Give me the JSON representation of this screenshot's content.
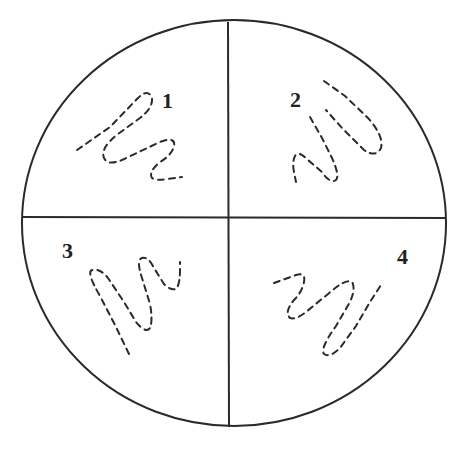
{
  "diagram": {
    "type": "petri-dish-streak-plate",
    "colors": {
      "line": "#2a2a2a",
      "background": "#ffffff"
    },
    "quadrants": [
      {
        "id": "q1",
        "label": "1",
        "position": "top-left"
      },
      {
        "id": "q2",
        "label": "2",
        "position": "top-right"
      },
      {
        "id": "q3",
        "label": "3",
        "position": "bottom-left"
      },
      {
        "id": "q4",
        "label": "4",
        "position": "bottom-right"
      }
    ]
  }
}
